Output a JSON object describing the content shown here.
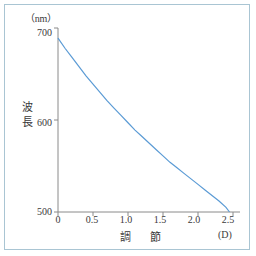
{
  "chart_data": {
    "type": "line",
    "title": "",
    "xlabel": "調　節",
    "ylabel": "波長",
    "x_unit": "(D)",
    "y_unit": "（nm）",
    "xlim": [
      0,
      2.6
    ],
    "ylim": [
      500,
      700
    ],
    "grid": false,
    "legend": "none",
    "line_color": "#5b9bd5",
    "axis_color": "#8a8a8a",
    "x_ticks": [
      "0",
      "0.5",
      "1.0",
      "1.5",
      "2.0",
      "2.5"
    ],
    "x_tick_values": [
      0,
      0.5,
      1.0,
      1.5,
      2.0,
      2.5
    ],
    "y_ticks": [
      "500",
      "600",
      "700"
    ],
    "y_tick_values": [
      500,
      600,
      700
    ],
    "series": [
      {
        "name": "波長",
        "x": [
          0.0,
          0.1,
          0.2,
          0.3,
          0.4,
          0.5,
          0.6,
          0.7,
          0.8,
          0.9,
          1.0,
          1.1,
          1.2,
          1.3,
          1.4,
          1.5,
          1.6,
          1.7,
          1.8,
          1.9,
          2.0,
          2.1,
          2.2,
          2.3,
          2.4,
          2.45
        ],
        "y": [
          689,
          678,
          668,
          658,
          648,
          639,
          630,
          621,
          613,
          605,
          597,
          589,
          582,
          575,
          568,
          561,
          554,
          548,
          542,
          536,
          530,
          524,
          518,
          512,
          505,
          500
        ]
      }
    ]
  },
  "figure": {
    "border_color": "#a9c5d3",
    "background": "#ffffff"
  }
}
